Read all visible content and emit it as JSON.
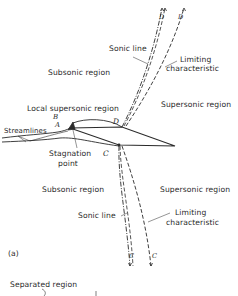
{
  "figure": {
    "panel_label": "(a)",
    "labels": {
      "subsonic_upper": "Subsonic region",
      "supersonic_upper": "Supersonic region",
      "subsonic_lower": "Subsonic region",
      "supersonic_lower": "Supersonic region",
      "local_supersonic": "Local supersonic region",
      "streamlines": "Streamlines",
      "stagnation_line1": "Stagnation",
      "stagnation_line2": "point",
      "sonic_line_upper": "Sonic line",
      "limiting_upper_1": "Limiting",
      "limiting_upper_2": "characteristic",
      "sonic_line_lower": "Sonic line",
      "limiting_lower_1": "Limiting",
      "limiting_lower_2": "characteristic",
      "separated_region": "Separated region"
    },
    "points": {
      "A": "A",
      "B": "B",
      "C": "C",
      "D": "D",
      "upper_sonic_end": "D",
      "upper_char_end": "D",
      "lower_sonic_end": "C",
      "lower_char_end": "C"
    },
    "colors": {
      "ink": "#2a2a2a",
      "background": "#ffffff"
    }
  }
}
